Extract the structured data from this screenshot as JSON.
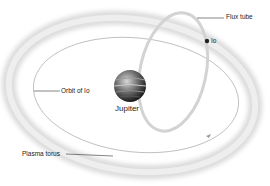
{
  "labels": {
    "flux_tube": "Flux tube",
    "io": "Io",
    "orbit_of_io": "Orbit of Io",
    "jupiter": "Jupiter",
    "plasma_torus": "Plasma torus"
  },
  "colors": {
    "torus": "#d9d9d9",
    "orbit": "#9a9a9a",
    "flux_tube": "#cfcfcf",
    "leader": "#333333",
    "jupiter_dark": "#2a2a2a",
    "jupiter_light": "#bdbdbd"
  }
}
